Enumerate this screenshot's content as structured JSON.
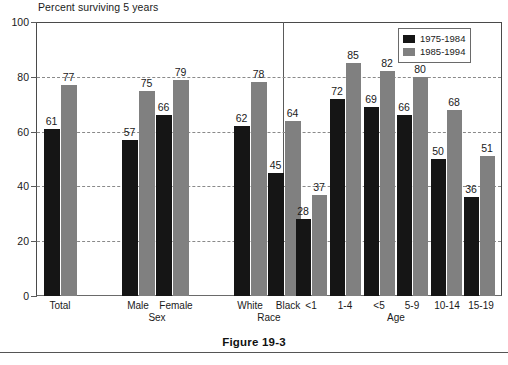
{
  "figure": {
    "caption": "Figure 19-3"
  },
  "legend": {
    "position": "top-right",
    "items": [
      {
        "label": "1975-1984",
        "color": "#151515",
        "swatch": "dark"
      },
      {
        "label": "1985-1994",
        "color": "#808080",
        "swatch": "light"
      }
    ]
  },
  "chart_data": {
    "type": "bar",
    "title": "Percent surviving 5 years",
    "xlabel": "",
    "ylabel": "",
    "ylim": [
      0,
      100
    ],
    "yticks": [
      0,
      20,
      40,
      60,
      80,
      100
    ],
    "grid": true,
    "grid_axis": "y",
    "categories": [
      "Total",
      "Male",
      "Female",
      "White",
      "Black",
      "<1",
      "1-4",
      "<5",
      "5-9",
      "10-14",
      "15-19"
    ],
    "group_labels": [
      "Sex",
      "Race",
      "Age"
    ],
    "series": [
      {
        "name": "1975-1984",
        "color": "#151515",
        "values": [
          61,
          57,
          66,
          62,
          45,
          28,
          72,
          69,
          66,
          50,
          36
        ]
      },
      {
        "name": "1985-1994",
        "color": "#808080",
        "values": [
          77,
          75,
          79,
          78,
          64,
          37,
          85,
          82,
          80,
          68,
          51
        ]
      }
    ],
    "panels": [
      {
        "name": "demographics",
        "groups": [
          {
            "group": "",
            "categories": [
              "Total"
            ]
          },
          {
            "group": "Sex",
            "categories": [
              "Male",
              "Female"
            ]
          },
          {
            "group": "Race",
            "categories": [
              "White",
              "Black"
            ]
          }
        ]
      },
      {
        "name": "age",
        "groups": [
          {
            "group": "Age",
            "categories": [
              "<1",
              "1-4",
              "<5",
              "5-9",
              "10-14",
              "15-19"
            ]
          }
        ]
      }
    ]
  }
}
